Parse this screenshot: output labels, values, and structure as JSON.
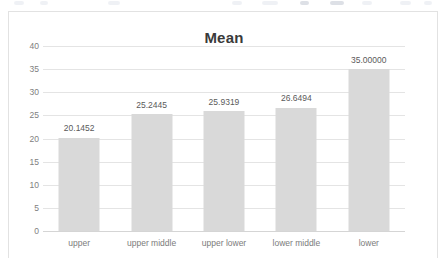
{
  "chart_data": {
    "type": "bar",
    "title": "Mean",
    "xlabel": "",
    "ylabel": "",
    "ylim": [
      0,
      40
    ],
    "yticks": [
      0,
      5,
      10,
      15,
      20,
      25,
      30,
      35,
      40
    ],
    "ytick_labels": [
      "0",
      "5",
      "10",
      "15",
      "20",
      "25",
      "30",
      "35",
      "40"
    ],
    "grid": "horizontal",
    "legend": "none",
    "bar_color": "#d9d9d9",
    "categories": [
      "upper",
      "upper middle",
      "upper lower",
      "lower middle",
      "lower"
    ],
    "values": [
      20.1452,
      25.2445,
      25.9319,
      26.6494,
      35.0
    ],
    "data_labels": [
      "20.1452",
      "25.2445",
      "25.9319",
      "26.6494",
      "35.00000"
    ],
    "series": [
      {
        "name": "Mean",
        "values": [
          20.1452,
          25.2445,
          25.9319,
          26.6494,
          35.0
        ]
      }
    ]
  }
}
